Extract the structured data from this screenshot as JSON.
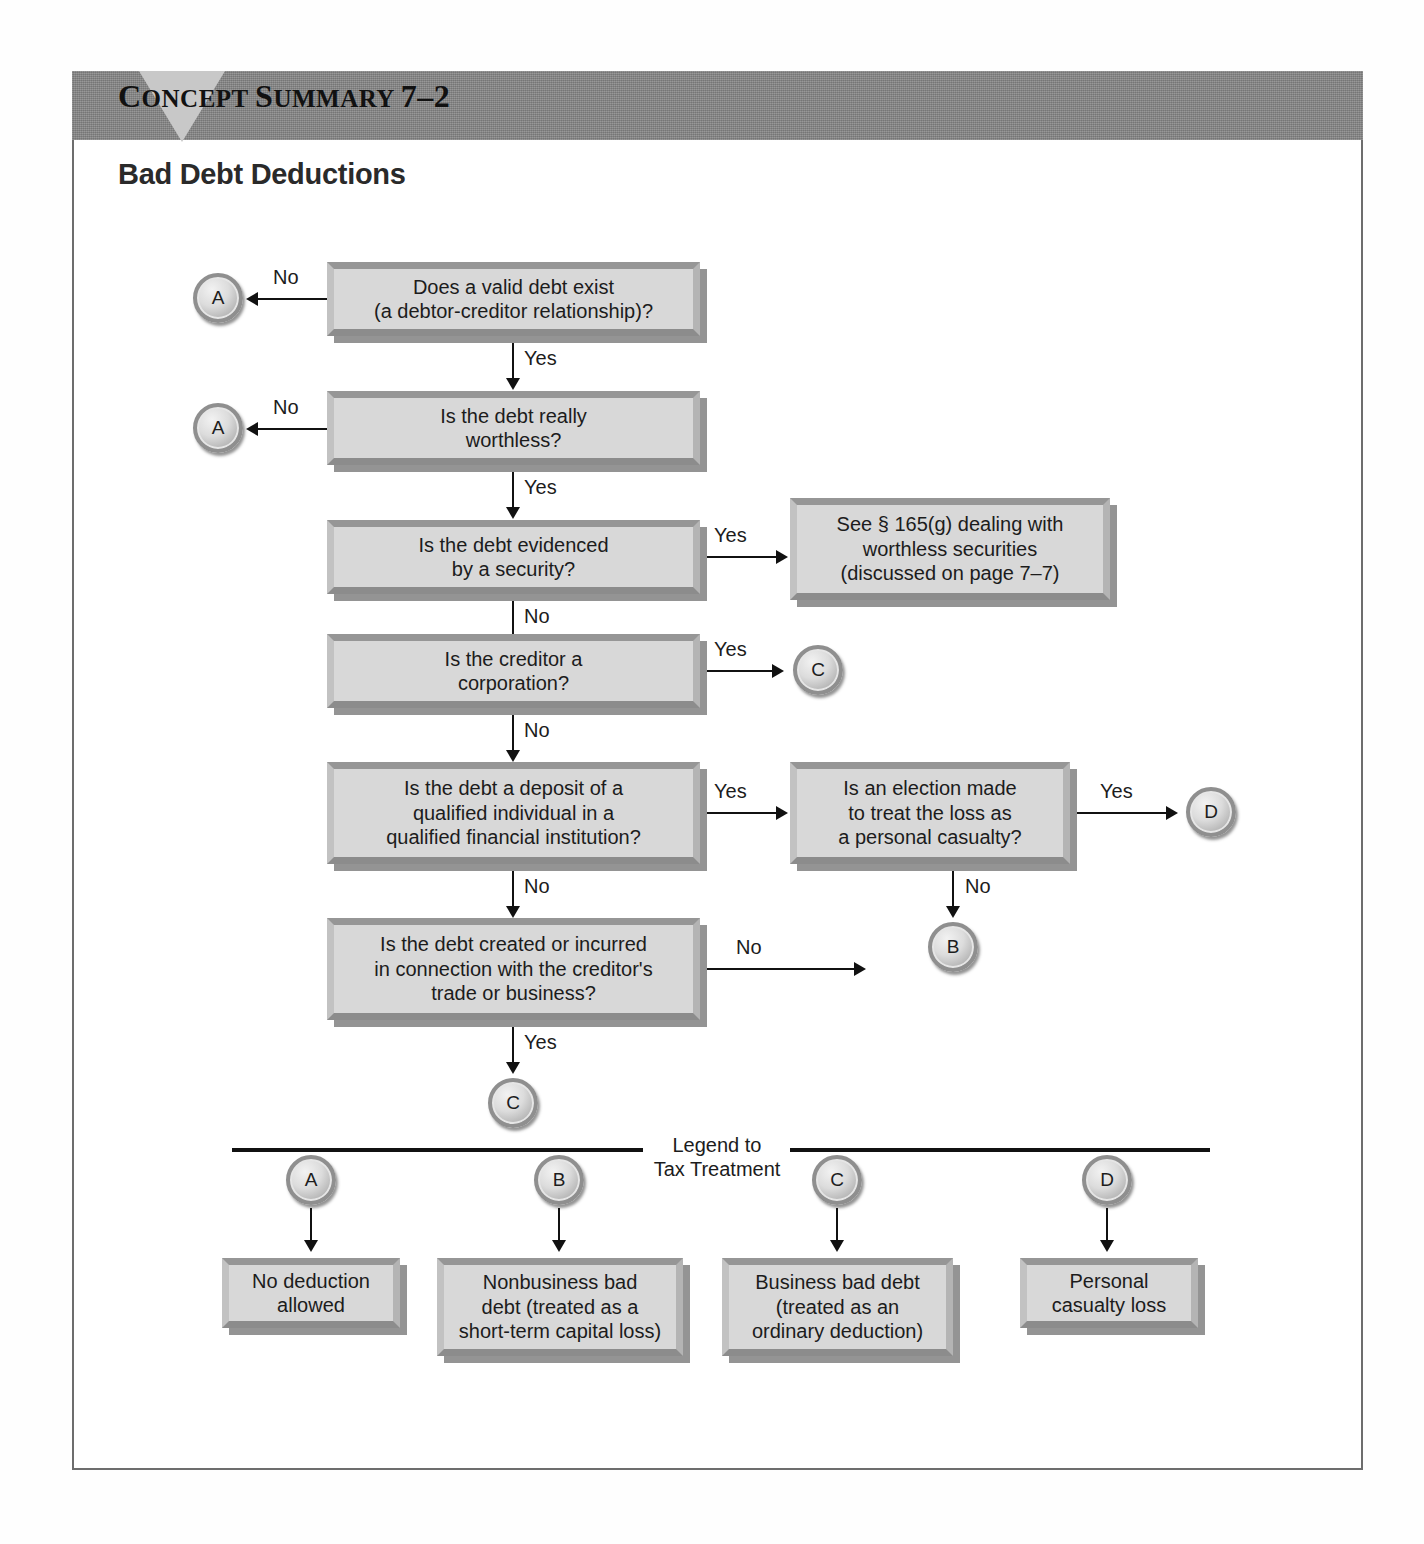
{
  "banner": {
    "label_concept": "C",
    "label_concept_rest": "ONCEPT ",
    "label_summary": "S",
    "label_summary_rest": "UMMARY ",
    "number": "7–2",
    "full": "CONCEPT SUMMARY 7–2"
  },
  "page_title": "Bad Debt Deductions",
  "flow": {
    "boxes": [
      {
        "id": "q1",
        "lines": [
          "Does a valid debt exist",
          "(a debtor-creditor relationship)?"
        ]
      },
      {
        "id": "q2",
        "lines": [
          "Is the debt really",
          "worthless?"
        ]
      },
      {
        "id": "q3",
        "lines": [
          "Is the debt evidenced",
          "by a security?"
        ]
      },
      {
        "id": "r1",
        "lines": [
          "See § 165(g) dealing with",
          "worthless securities",
          "(discussed on page 7–7)"
        ]
      },
      {
        "id": "q4",
        "lines": [
          "Is the creditor a",
          "corporation?"
        ]
      },
      {
        "id": "q5",
        "lines": [
          "Is the debt a deposit of a",
          "qualified individual in a",
          "qualified financial institution?"
        ]
      },
      {
        "id": "q6",
        "lines": [
          "Is an election made",
          "to treat the loss as",
          "a personal casualty?"
        ]
      },
      {
        "id": "q7",
        "lines": [
          "Is the debt created or incurred",
          "in connection with the creditor's",
          "trade or business?"
        ]
      }
    ],
    "connectors": [
      {
        "id": "c-a1",
        "letter": "A"
      },
      {
        "id": "c-a2",
        "letter": "A"
      },
      {
        "id": "c-c1",
        "letter": "C"
      },
      {
        "id": "c-d1",
        "letter": "D"
      },
      {
        "id": "c-b1",
        "letter": "B"
      },
      {
        "id": "c-c2",
        "letter": "C"
      }
    ],
    "edge_labels": {
      "no1": "No",
      "yes1": "Yes",
      "no2": "No",
      "yes2": "Yes",
      "yes3": "Yes",
      "no3": "No",
      "yes4": "Yes",
      "no4": "No",
      "yes5": "Yes",
      "yes6": "Yes",
      "no5": "No",
      "no6": "No",
      "yes7": "Yes"
    }
  },
  "legend": {
    "title_line1": "Legend to",
    "title_line2": "Tax Treatment",
    "items": [
      {
        "letter": "A",
        "lines": [
          "No deduction",
          "allowed"
        ]
      },
      {
        "letter": "B",
        "lines": [
          "Nonbusiness bad",
          "debt (treated as a",
          "short-term capital loss)"
        ]
      },
      {
        "letter": "C",
        "lines": [
          "Business bad debt",
          "(treated as an",
          "ordinary deduction)"
        ]
      },
      {
        "letter": "D",
        "lines": [
          "Personal",
          "casualty loss"
        ]
      }
    ]
  },
  "colors": {
    "banner": "#838383",
    "triangle": "#c8c8c8",
    "box_fill": "#d8d8d8",
    "frame_border": "#6d6d6d",
    "ink": "#111111"
  }
}
